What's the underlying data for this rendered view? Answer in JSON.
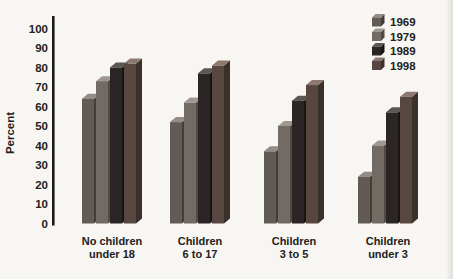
{
  "chart_data": {
    "type": "bar",
    "style": "3d-columns",
    "title": "",
    "xlabel": "",
    "ylabel": "Percent",
    "ylim": [
      0,
      100
    ],
    "ytick_step": 10,
    "yticks": [
      0,
      10,
      20,
      30,
      40,
      50,
      60,
      70,
      80,
      90,
      100
    ],
    "grid": false,
    "legend_position": "top-right",
    "categories": [
      "No children under 18",
      "Children 6 to 17",
      "Children 3 to 5",
      "Children under 3"
    ],
    "category_labels": [
      [
        "No children",
        "under 18"
      ],
      [
        "Children",
        "6 to 17"
      ],
      [
        "Children",
        "3 to 5"
      ],
      [
        "Children",
        "under 3"
      ]
    ],
    "series": [
      {
        "name": "1969",
        "values": [
          64,
          52,
          37,
          24
        ],
        "color": {
          "front": "#625a54",
          "top": "#948c84",
          "side": "#433d38"
        }
      },
      {
        "name": "1979",
        "values": [
          73,
          62,
          50,
          40
        ],
        "color": {
          "front": "#716b64",
          "top": "#a09890",
          "side": "#514b45"
        }
      },
      {
        "name": "1989",
        "values": [
          80,
          77,
          63,
          57
        ],
        "color": {
          "front": "#2b2625",
          "top": "#5d5753",
          "side": "#181514"
        }
      },
      {
        "name": "1998",
        "values": [
          82,
          81,
          71,
          65
        ],
        "color": {
          "front": "#584640",
          "top": "#8d7970",
          "side": "#3c302b"
        }
      }
    ]
  },
  "colors": {
    "background": "#f7f6f3",
    "axis": "#1c1a19",
    "text": "#222120"
  }
}
